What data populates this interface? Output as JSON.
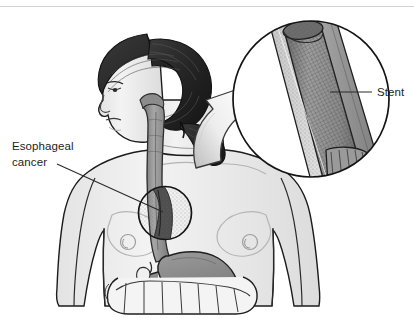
{
  "figure": {
    "width": 414,
    "height": 318,
    "background_color": "#ffffff",
    "top_rule_color": "#d2d2d2"
  },
  "labels": {
    "esophageal_cancer_line1": "Esophageal",
    "esophageal_cancer_line2": "cancer",
    "stent": "Stent"
  },
  "colors": {
    "outline": "#1a1a1a",
    "hair": "#2b2b2b",
    "hair_highlight": "#4a4a4a",
    "skin": "#efefef",
    "skin_shade": "#dcdcdc",
    "esophagus": "#9a9a9a",
    "esophagus_dark": "#6e6e6e",
    "stomach": "#8d8d8d",
    "intestine": "#f2f2f2",
    "tumor": "#5a5a5a",
    "stent_mesh": "#8f8f8f",
    "stent_wall": "#cfcfcf",
    "arrow_light": "#fdfdfd",
    "arrow_shade": "#c9c9c9",
    "leader_line": "#2a2a2a"
  },
  "anatomy": {
    "figure_view": "female torso and head, left profile",
    "organs": [
      "esophagus",
      "stomach",
      "duodenum",
      "large intestine",
      "gallbladder"
    ],
    "tumor_marker": {
      "shape": "circle",
      "center_x": 165,
      "center_y": 213,
      "radius": 27,
      "description": "narrowed esophageal segment with tumor"
    }
  },
  "inset": {
    "shape": "circle",
    "center_x": 311,
    "center_y": 99,
    "radius": 79,
    "description": "magnified view of esophagus with expandable mesh stent in place",
    "contents": [
      "esophageal wall",
      "tumor tissue",
      "mesh stent lumen"
    ]
  },
  "arrow": {
    "description": "curved 3D arrow pointing from torso tumor site up toward inset circle",
    "direction": "up-right"
  }
}
